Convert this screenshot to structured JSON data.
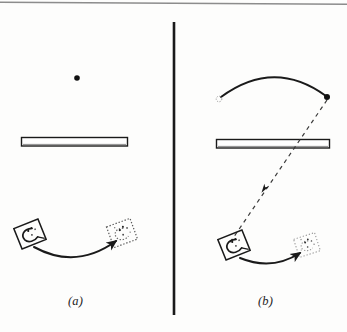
{
  "figure": {
    "type": "line-diagram",
    "background_color": "#fdfdfc",
    "ink_color": "#1a1a1a",
    "faint_ink_color": "#9a9a9a",
    "top_rule": {
      "name": "top-border-rule",
      "x1": 0,
      "y1": 2,
      "x2": 347,
      "y2": 4,
      "color": "#8c8c8c",
      "width": 1.6
    },
    "divider": {
      "name": "panel-divider",
      "x": 174,
      "y1": 22,
      "y2": 315,
      "color": "#1a1a1a",
      "width": 2.6
    },
    "panels": [
      {
        "id": "a",
        "label": "(a)",
        "label_x": 78,
        "label_y": 302,
        "elements": {
          "dot": {
            "name": "ball-dot",
            "cx": 77,
            "cy": 78,
            "r": 2.8,
            "color": "#111111"
          },
          "bar": {
            "name": "horizontal-barrier",
            "x": 21,
            "y": 137,
            "w": 107,
            "h": 9,
            "stroke": "#1a1a1a",
            "fill": "#ffffff",
            "stroke_width": 1.4
          },
          "hand_start": {
            "name": "hand-start",
            "cx": 30,
            "cy": 234,
            "size": 25,
            "rotation": -22,
            "style": "solid"
          },
          "hand_end": {
            "name": "hand-end-ghost",
            "cx": 122,
            "cy": 233,
            "size": 25,
            "rotation": -20,
            "style": "dotted"
          },
          "arc": {
            "name": "motion-arc",
            "x1": 34,
            "y1": 247,
            "cx": 76,
            "cy": 270,
            "x2": 116,
            "y2": 241,
            "arrow": "end",
            "style": "solid"
          }
        }
      },
      {
        "id": "b",
        "label": "(b)",
        "label_x": 268,
        "label_y": 302,
        "elements": {
          "upper_arc": {
            "name": "upper-trajectory-arc",
            "x1": 221,
            "y1": 97,
            "cx": 274,
            "cy": 58,
            "x2": 326,
            "y2": 96,
            "arrow": "none",
            "style": "solid"
          },
          "arc_start_marker": {
            "name": "arc-start-ghost-dot",
            "cx": 220,
            "cy": 98,
            "r": 2.6,
            "style": "dotted"
          },
          "arc_end_dot": {
            "name": "arc-end-dot",
            "cx": 327,
            "cy": 97,
            "r": 3.0,
            "color": "#111111"
          },
          "bar": {
            "name": "horizontal-barrier",
            "x": 216,
            "y": 139,
            "w": 114,
            "h": 9,
            "stroke": "#1a1a1a",
            "fill": "#ffffff",
            "stroke_width": 1.4
          },
          "dashed_line": {
            "name": "dashed-return-path",
            "x1": 327,
            "y1": 98,
            "x2": 229,
            "y2": 243,
            "arrow_at": {
              "x": 264,
              "y": 189
            },
            "style": "dashed",
            "dash": "4 4"
          },
          "hand_start": {
            "name": "hand-start",
            "cx": 234,
            "cy": 245,
            "size": 25,
            "rotation": -22,
            "style": "solid"
          },
          "hand_end": {
            "name": "hand-end-ghost",
            "cx": 307,
            "cy": 245,
            "size": 22,
            "rotation": -18,
            "style": "dotted"
          },
          "arc": {
            "name": "motion-arc",
            "x1": 240,
            "y1": 258,
            "cx": 272,
            "cy": 271,
            "x2": 300,
            "y2": 253,
            "arrow": "end",
            "style": "solid"
          }
        }
      }
    ]
  }
}
